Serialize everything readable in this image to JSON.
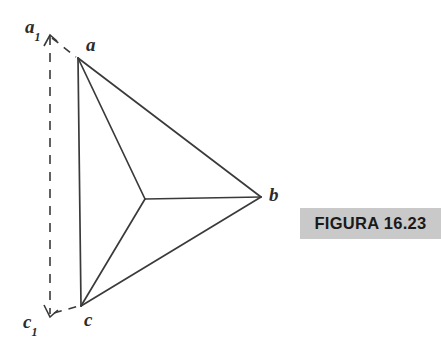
{
  "figure": {
    "caption": "FIGURA 16.23",
    "caption_background_color": "#c9c9c9",
    "caption_text_color": "#1a1a1a",
    "stroke_color": "#3a3a3a",
    "background_color": "#ffffff",
    "labels": {
      "a1": {
        "base": "a",
        "sub": "1"
      },
      "a": {
        "base": "a",
        "sub": ""
      },
      "b": {
        "base": "b",
        "sub": ""
      },
      "c": {
        "base": "c",
        "sub": ""
      },
      "c1": {
        "base": "c",
        "sub": "1"
      }
    },
    "geometry": {
      "vertices": {
        "a": {
          "x": 78,
          "y": 58
        },
        "b": {
          "x": 261,
          "y": 197
        },
        "c": {
          "x": 81,
          "y": 306
        },
        "center": {
          "x": 145,
          "y": 199
        },
        "a1_arrow_tip": {
          "x": 50,
          "y": 36
        },
        "c1_arrow_tip": {
          "x": 50,
          "y": 316
        }
      },
      "solid_edges": [
        {
          "name": "edge-a-b",
          "from": "a",
          "to": "b"
        },
        {
          "name": "edge-b-c",
          "from": "b",
          "to": "c"
        },
        {
          "name": "edge-a-c",
          "from": "a",
          "to": "c"
        },
        {
          "name": "spoke-center-a",
          "from": "center",
          "to": "a"
        },
        {
          "name": "spoke-center-b",
          "from": "center",
          "to": "b"
        },
        {
          "name": "spoke-center-c",
          "from": "center",
          "to": "c"
        }
      ],
      "dashed_edges": [
        {
          "name": "dashed-vertical-a1-c1",
          "from": "a1_arrow_tip",
          "to": "c1_arrow_tip"
        },
        {
          "name": "dashed-a1-to-a",
          "from": "a1_arrow_tip",
          "to": "a"
        },
        {
          "name": "dashed-c1-to-c",
          "from": "c1_arrow_tip",
          "to": "c"
        }
      ]
    }
  }
}
